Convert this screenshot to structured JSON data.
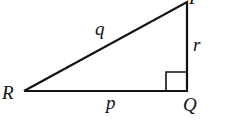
{
  "diagram": {
    "type": "right-triangle",
    "vertices": [
      {
        "id": "P",
        "label": "P"
      },
      {
        "id": "Q",
        "label": "Q"
      },
      {
        "id": "R",
        "label": "R"
      }
    ],
    "sides": [
      {
        "between": [
          "R",
          "P"
        ],
        "label": "q"
      },
      {
        "between": [
          "P",
          "Q"
        ],
        "label": "r"
      },
      {
        "between": [
          "R",
          "Q"
        ],
        "label": "p"
      }
    ],
    "right_angle_at": "Q",
    "stroke_color": "#111111"
  }
}
